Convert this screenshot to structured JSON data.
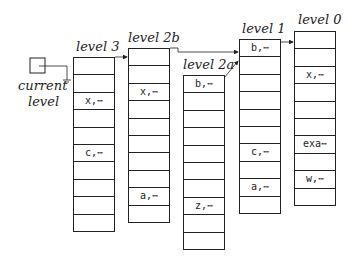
{
  "current_level": {
    "label_line1": "current",
    "label_line2": "level"
  },
  "columns": [
    {
      "id": "level3",
      "label": "level 3",
      "cells": [
        "",
        "",
        "x,⋯",
        "",
        "",
        "c,⋯",
        "",
        "",
        "",
        ""
      ]
    },
    {
      "id": "level2b",
      "label": "level 2b",
      "cells": [
        "",
        "",
        "x,⋯",
        "",
        "",
        "",
        "",
        "",
        "a,⋯",
        ""
      ]
    },
    {
      "id": "level2a",
      "label": "level 2a",
      "cells": [
        "b,⋯",
        "",
        "",
        "",
        "",
        "",
        "",
        "z,⋯",
        "",
        ""
      ]
    },
    {
      "id": "level1",
      "label": "level 1",
      "cells": [
        "b,⋯",
        "",
        "",
        "",
        "",
        "",
        "c,⋯",
        "",
        "a,⋯",
        ""
      ]
    },
    {
      "id": "level0",
      "label": "level 0",
      "cells": [
        "",
        "",
        "x,⋯",
        "",
        "",
        "",
        "exa⋯",
        "",
        "w,⋯",
        ""
      ]
    }
  ],
  "links": [
    {
      "from": "current-level",
      "to": "level3"
    },
    {
      "from": "level3",
      "to": "level2b"
    },
    {
      "from": "level2b",
      "to": "level1"
    },
    {
      "from": "level2a",
      "to": "level1"
    },
    {
      "from": "level1",
      "to": "level0"
    }
  ]
}
